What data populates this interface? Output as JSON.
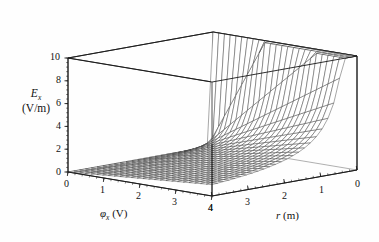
{
  "chart_data": {
    "type": "line",
    "render": "surface3d-wireframe",
    "title": "",
    "subtitle": "",
    "function": "E_x = phi_x / r",
    "zlabel": "E_x",
    "zunit": "(V/m)",
    "zlabel_parts": {
      "symbol": "E",
      "subscript": "x",
      "unit": "(V/m)"
    },
    "xlabel": "φ_x (V)",
    "xlabel_parts": {
      "symbol": "φ",
      "subscript": "x",
      "unit": "(V)"
    },
    "ylabel": "r (m)",
    "ylabel_parts": {
      "symbol": "r",
      "unit": "(m)"
    },
    "zticks": [
      0,
      2,
      4,
      6,
      8,
      10
    ],
    "ztick_labels": [
      "0",
      "2",
      "4",
      "6",
      "8",
      "10"
    ],
    "zlim": [
      0,
      10
    ],
    "xticks": [
      0,
      1,
      2,
      3,
      4
    ],
    "xtick_labels": [
      "0",
      "1",
      "2",
      "3",
      "4"
    ],
    "xlim": [
      0,
      4
    ],
    "yticks": [
      4,
      3,
      2,
      1,
      0
    ],
    "ytick_labels": [
      "4",
      "3",
      "2",
      "1",
      "0"
    ],
    "ylim": [
      0,
      4
    ],
    "y_axis_reversed": true,
    "grid": false,
    "legend": null,
    "mesh": {
      "nx": 25,
      "ny": 25,
      "color": "#3a3a3a",
      "line_width": 0.45
    },
    "box": {
      "color": "#1a1a1a",
      "line_width": 0.9
    },
    "minor_ticks_per_interval": 5
  },
  "geometry": {
    "origin": {
      "x": 68,
      "y": 172
    },
    "x_front": {
      "x": 212,
      "y": 196
    },
    "y_right": {
      "x": 357,
      "y": 170
    },
    "back_corner": {
      "x": 215,
      "y": 146
    },
    "z_height": 114
  },
  "tick_positions": {
    "z": [
      {
        "label": "10",
        "x": 50,
        "y": 52
      },
      {
        "label": "8",
        "x": 56,
        "y": 75
      },
      {
        "label": "6",
        "x": 56,
        "y": 98
      },
      {
        "label": "4",
        "x": 56,
        "y": 121
      },
      {
        "label": "2",
        "x": 56,
        "y": 144
      },
      {
        "label": "0",
        "x": 56,
        "y": 167
      }
    ],
    "x": [
      {
        "label": "0",
        "x": 64,
        "y": 179
      },
      {
        "label": "1",
        "x": 100,
        "y": 185
      },
      {
        "label": "2",
        "x": 136,
        "y": 191
      },
      {
        "label": "3",
        "x": 172,
        "y": 197
      },
      {
        "label": "4",
        "x": 208,
        "y": 203
      }
    ],
    "y": [
      {
        "label": "4",
        "x": 208,
        "y": 203
      },
      {
        "label": "3",
        "x": 245,
        "y": 197
      },
      {
        "label": "2",
        "x": 282,
        "y": 191
      },
      {
        "label": "1",
        "x": 319,
        "y": 185
      },
      {
        "label": "0",
        "x": 355,
        "y": 179
      }
    ]
  },
  "axis_title_positions": {
    "x": {
      "left": 100,
      "top": 208
    },
    "y": {
      "left": 276,
      "top": 210
    }
  },
  "colors": {
    "background": "#fefefe",
    "mesh": "#3a3a3a",
    "axis": "#1a1a1a",
    "text": "#111111"
  }
}
